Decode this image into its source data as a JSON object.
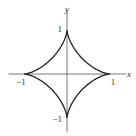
{
  "chart_data": {
    "type": "line",
    "title": "",
    "equation": "x^(2/3) + y^(2/3) = 1",
    "curve_name": "astroid",
    "parametric": {
      "x": "cos(t)^3",
      "y": "sin(t)^3",
      "t_range": [
        0,
        6.2832
      ]
    },
    "xlabel": "x",
    "ylabel": "y",
    "xlim": [
      -1.45,
      1.4
    ],
    "ylim": [
      -1.35,
      1.55
    ],
    "grid": false,
    "series": [
      {
        "name": "astroid",
        "points": [
          {
            "x": 1,
            "y": 0
          },
          {
            "x": 0.65,
            "y": 0.0548
          },
          {
            "x": 0.3536,
            "y": 0.3536
          },
          {
            "x": 0.0548,
            "y": 0.65
          },
          {
            "x": 0,
            "y": 1
          },
          {
            "x": -0.0548,
            "y": 0.65
          },
          {
            "x": -0.3536,
            "y": 0.3536
          },
          {
            "x": -0.65,
            "y": 0.0548
          },
          {
            "x": -1,
            "y": 0
          },
          {
            "x": -0.65,
            "y": -0.0548
          },
          {
            "x": -0.3536,
            "y": -0.3536
          },
          {
            "x": -0.0548,
            "y": -0.65
          },
          {
            "x": 0,
            "y": -1
          },
          {
            "x": 0.0548,
            "y": -0.65
          },
          {
            "x": 0.3536,
            "y": -0.3536
          },
          {
            "x": 0.65,
            "y": -0.0548
          }
        ]
      }
    ],
    "tick_labels": {
      "x": [
        {
          "value": -1,
          "label": "−1"
        },
        {
          "value": 1,
          "label": "1"
        }
      ],
      "y": [
        {
          "value": 1,
          "label": "1"
        },
        {
          "value": -1,
          "label": "−1"
        }
      ]
    }
  },
  "colors": {
    "curve": "#222222",
    "axis": "#555555",
    "text": "#333333"
  }
}
